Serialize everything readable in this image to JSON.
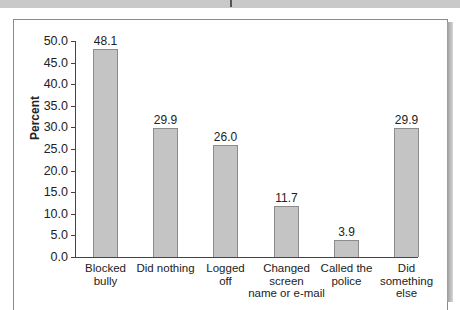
{
  "chart_data": {
    "type": "bar",
    "title": "",
    "xlabel": "",
    "ylabel": "Percent",
    "ylim": [
      0,
      50
    ],
    "yticks": [
      "0.0",
      "5.0",
      "10.0",
      "15.0",
      "20.0",
      "25.0",
      "30.0",
      "35.0",
      "40.0",
      "45.0",
      "50.0"
    ],
    "grid": false,
    "legend": null,
    "categories": [
      "Blocked bully",
      "Did nothing",
      "Logged off",
      "Changed screen name or e-mail",
      "Called the police",
      "Did something else"
    ],
    "category_lines": [
      [
        "Blocked",
        "bully"
      ],
      [
        "Did nothing"
      ],
      [
        "Logged",
        "off"
      ],
      [
        "Changed",
        "screen",
        "name or e-mail"
      ],
      [
        "Called the",
        "police"
      ],
      [
        "Did",
        "something",
        "else"
      ]
    ],
    "values": [
      48.1,
      29.9,
      26.0,
      11.7,
      3.9,
      29.9
    ],
    "value_labels": [
      "48.1",
      "29.9",
      "26.0",
      "11.7",
      "3.9",
      "29.9"
    ],
    "colors": {
      "bar_fill": "#c4c4c4",
      "bar_edge": "#8c8c8c",
      "axis": "#444444"
    }
  }
}
